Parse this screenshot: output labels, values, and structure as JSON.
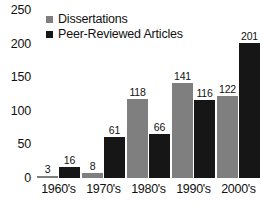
{
  "chart_data": {
    "type": "bar",
    "title": "",
    "xlabel": "",
    "ylabel": "",
    "categories": [
      "1960's",
      "1970's",
      "1980's",
      "1990's",
      "2000's"
    ],
    "series": [
      {
        "name": "Dissertations",
        "color": "#7f7f7f",
        "values": [
          3,
          8,
          118,
          141,
          122
        ]
      },
      {
        "name": "Peer-Reviewed Articles",
        "color": "#161616",
        "values": [
          16,
          61,
          66,
          116,
          201
        ]
      }
    ],
    "ylim": [
      0,
      250
    ],
    "yticks": [
      0,
      50,
      100,
      150,
      200,
      250
    ],
    "ytick_labels": [
      "0",
      "50",
      "100",
      "150",
      "200",
      "250"
    ],
    "grid": false,
    "legend_position": "top-left",
    "data_labels": true
  },
  "legend": {
    "items": [
      {
        "label": "Dissertations",
        "swatch": "legend-swatch-dissertations"
      },
      {
        "label": "Peer-Reviewed Articles",
        "swatch": "legend-swatch-articles"
      }
    ]
  }
}
